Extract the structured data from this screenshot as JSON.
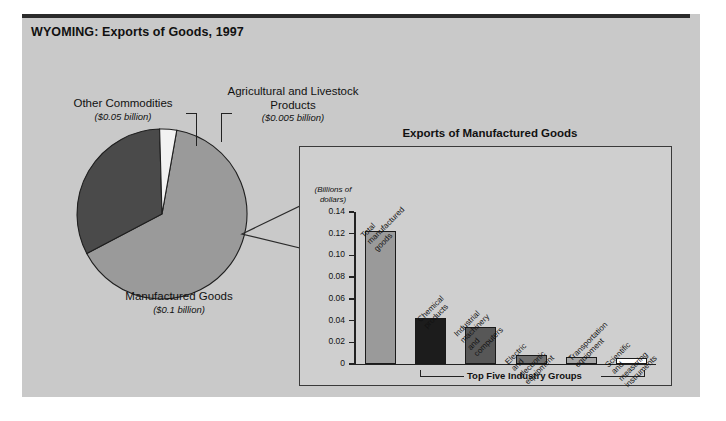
{
  "figure": {
    "title": "WYOMING: Exports of Goods, 1997"
  },
  "pie_labels": {
    "other": {
      "name": "Other Commodities",
      "amount": "($0.05 billion)"
    },
    "agricultural": {
      "name": "Agricultural and Livestock Products",
      "amount": "($0.005 billion)"
    },
    "manufactured": {
      "name": "Manufactured Goods",
      "amount": "($0.1 billion)"
    }
  },
  "inset": {
    "title": "Exports of Manufactured Goods",
    "axis_units": "(Billions of dollars)",
    "group_label": "Top Five Industry Groups"
  },
  "chart_data": [
    {
      "type": "pie",
      "title": "WYOMING: Exports of Goods, 1997",
      "unit": "billions of dollars",
      "labels": [
        "Manufactured Goods",
        "Other Commodities",
        "Agricultural and Livestock Products"
      ],
      "values": [
        0.1,
        0.05,
        0.005
      ],
      "value_texts": [
        "($0.1 billion)",
        "($0.05 billion)",
        "($0.005 billion)"
      ],
      "colors": [
        "#9a9a9a",
        "#4a4a4a",
        "#f2f2f2"
      ],
      "legend": "labels-outside"
    },
    {
      "type": "bar",
      "title": "Exports of Manufactured Goods",
      "ylabel": "(Billions of dollars)",
      "xlabel": "Top Five Industry Groups",
      "categories": [
        "Total manufactured goods",
        "Chemical products",
        "Industrial machinery and computers",
        "Electric and electronic equipment",
        "Transportation equipment",
        "Scientific and measuring instruments"
      ],
      "values": [
        0.1225,
        0.042,
        0.034,
        0.008,
        0.0065,
        0.0055
      ],
      "colors": [
        "#9a9a9a",
        "#1c1c1c",
        "#575757",
        "#6f6f6f",
        "#a5a5a5",
        "#ffffff"
      ],
      "ylim": [
        0,
        0.14
      ],
      "yticks": [
        0,
        0.02,
        0.04,
        0.06,
        0.08,
        0.1,
        0.12,
        0.14
      ],
      "ytick_labels": [
        "0",
        "0.02",
        "0.04",
        "0.06",
        "0.08",
        "0.10",
        "0.12",
        "0.14"
      ],
      "grid": false,
      "legend": "none"
    }
  ],
  "colors": {
    "panel_background": "#c9c9c9",
    "inset_background": "#cfcfcf",
    "rule": "#2b2b2b",
    "axis": "#222222"
  }
}
